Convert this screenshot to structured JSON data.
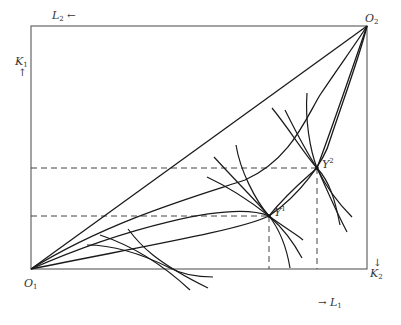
{
  "diagram": {
    "type": "edgeworth-box-production",
    "origins": {
      "o1": {
        "base": "O",
        "sub": "1"
      },
      "o2": {
        "base": "O",
        "sub": "2"
      }
    },
    "axes": {
      "l2": {
        "base": "L",
        "sub": "2",
        "arrow": "←"
      },
      "k1": {
        "base": "K",
        "sub": "1",
        "arrow": "↑"
      },
      "k2": {
        "base": "K",
        "sub": "2",
        "arrow": "↓"
      },
      "l1": {
        "base": "L",
        "sub": "1",
        "arrow": "→"
      }
    },
    "points": {
      "y1": {
        "base": "Y",
        "sup": "1"
      },
      "y2": {
        "base": "Y",
        "sup": "2"
      }
    },
    "colors": {
      "line": "#1a1a1a",
      "box": "#555555",
      "dash": "#444444"
    }
  }
}
